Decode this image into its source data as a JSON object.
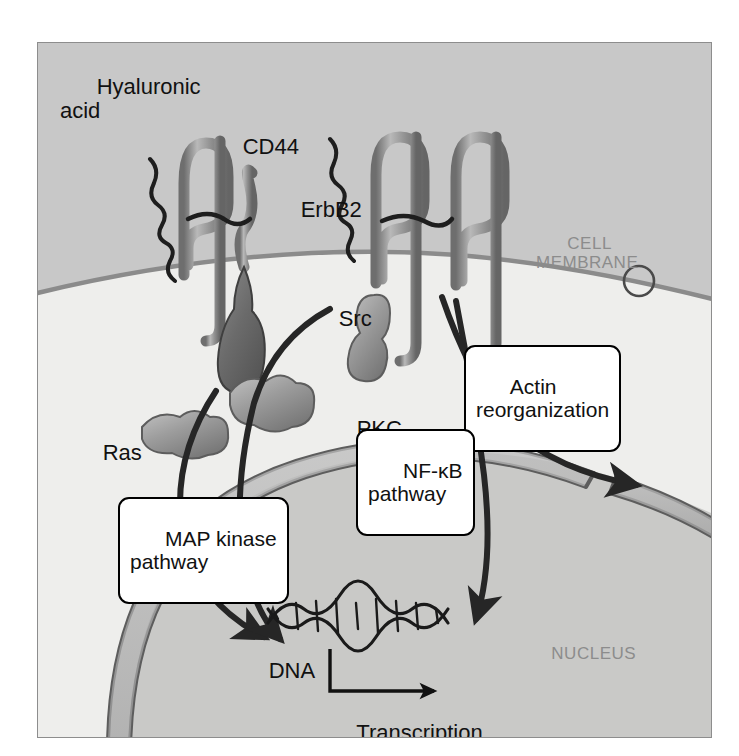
{
  "figure": {
    "background_color": "#c8c8c8",
    "cytoplasm_color": "#eeeeec",
    "nucleus_color": "#c9c9c7",
    "membrane_color": "#8b8b8b",
    "arrow_color": "#262626",
    "protein_color": "#9a9a9a",
    "protein_dark_color": "#6f6f6f"
  },
  "region_labels": [
    {
      "id": "cell-membrane",
      "text": "CELL\nMEMBRANE"
    },
    {
      "id": "cytoplasm",
      "text": "CYTOPLASM"
    },
    {
      "id": "nucleus",
      "text": "NUCLEUS"
    }
  ],
  "molecule_labels": [
    {
      "id": "hyaluronic-acid",
      "text": "Hyaluronic\nacid"
    },
    {
      "id": "cd44",
      "text": "CD44"
    },
    {
      "id": "erbb2",
      "text": "ErbB2"
    },
    {
      "id": "src",
      "text": "Src"
    },
    {
      "id": "pkc",
      "text": "PKC"
    },
    {
      "id": "ras",
      "text": "Ras"
    },
    {
      "id": "dna",
      "text": "DNA"
    },
    {
      "id": "transcription-activation",
      "text": "Transcription\nactivation"
    }
  ],
  "pathway_callouts": [
    {
      "id": "actin-reorganization",
      "text": "Actin\nreorganization"
    },
    {
      "id": "nf-kb-pathway",
      "text": "NF-κB\npathway"
    },
    {
      "id": "map-kinase-pathway",
      "text": "MAP kinase\npathway"
    }
  ]
}
